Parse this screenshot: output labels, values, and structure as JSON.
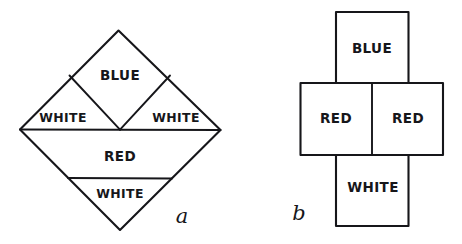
{
  "canvas": {
    "width": 462,
    "height": 244,
    "background": "#ffffff",
    "ink": "#16161a"
  },
  "figures": [
    {
      "id": "a",
      "caption": "a",
      "shape": "diamond",
      "regions": [
        {
          "name": "blue-region",
          "label": "BLUE",
          "position": "top-center-inner-diamond"
        },
        {
          "name": "white-region-left",
          "label": "WHITE",
          "position": "upper-left-triangle"
        },
        {
          "name": "white-region-right",
          "label": "WHITE",
          "position": "upper-right-triangle"
        },
        {
          "name": "red-region",
          "label": "RED",
          "position": "lower-trapezoid"
        },
        {
          "name": "white-region-bottom",
          "label": "WHITE",
          "position": "bottom-triangle"
        }
      ]
    },
    {
      "id": "b",
      "caption": "b",
      "shape": "cross",
      "regions": [
        {
          "name": "blue-region",
          "label": "BLUE",
          "position": "top-square"
        },
        {
          "name": "red-region-left",
          "label": "RED",
          "position": "middle-left-square"
        },
        {
          "name": "red-region-right",
          "label": "RED",
          "position": "middle-right-square"
        },
        {
          "name": "white-region",
          "label": "WHITE",
          "position": "bottom-square"
        }
      ]
    }
  ]
}
